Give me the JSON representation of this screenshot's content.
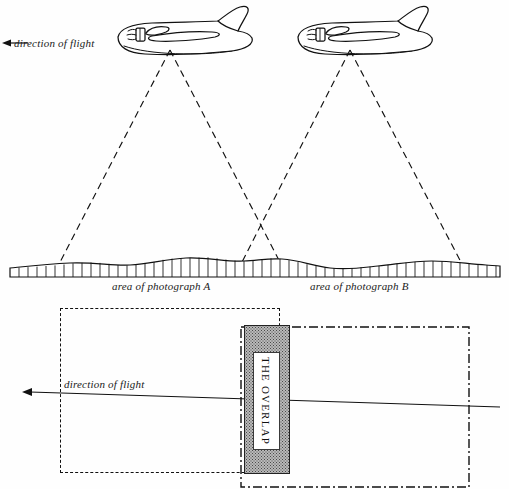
{
  "figure": {
    "title_visible": false,
    "width": 509,
    "height": 489,
    "background_color": "#fefefe",
    "ink_color": "#111111"
  },
  "upper_diagram": {
    "description": "Side view: two aircraft in flight with dashed camera field-of-view cones projected onto a hatched ground profile",
    "direction_of_flight_label": "direction of flight",
    "arrow_direction": "left",
    "aircraft": [
      {
        "name": "aircraft-a",
        "camera_apex_x": 170,
        "camera_apex_y": 50
      },
      {
        "name": "aircraft-b",
        "camera_apex_x": 350,
        "camera_apex_y": 50
      }
    ],
    "cones": [
      {
        "name": "camera-cone-a",
        "apex": [
          170,
          50
        ],
        "left_base": [
          58,
          266
        ],
        "right_base": [
          282,
          266
        ]
      },
      {
        "name": "camera-cone-b",
        "apex": [
          350,
          50
        ],
        "left_base": [
          240,
          266
        ],
        "right_base": [
          463,
          266
        ]
      }
    ],
    "cone_crossing_point": [
      261,
      256
    ],
    "ground_strip": {
      "top_y": 262,
      "bottom_y": 276,
      "left_x": 10,
      "right_x": 500,
      "hatch_spacing_px": 9
    },
    "area_label_a": "area of photograph A",
    "area_label_b": "area of photograph B"
  },
  "lower_diagram": {
    "description": "Plan view: footprint of photograph A (dashed) and photograph B (dash-dot) sharing a stippled overlap band",
    "direction_of_flight_label": "direction of flight",
    "arrow_direction": "left",
    "overlap_label": "THE OVERLAP",
    "rect_photo_a": {
      "x": 60,
      "y": 308,
      "width": 220,
      "height": 165,
      "border_style": "dashed"
    },
    "rect_photo_b": {
      "x": 241,
      "y": 327,
      "width": 228,
      "height": 160,
      "border_style": "dash-dot"
    },
    "overlap_band": {
      "x": 244,
      "y": 325,
      "width": 44,
      "height": 147,
      "fill": "#b9b9b9",
      "pattern": "stipple"
    },
    "flight_line": {
      "start": [
        30,
        392
      ],
      "end": [
        500,
        407
      ]
    }
  }
}
